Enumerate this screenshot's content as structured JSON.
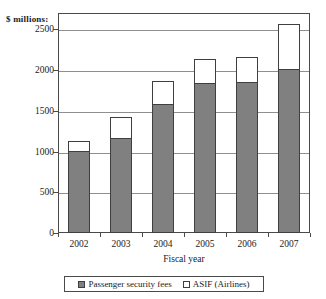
{
  "chart_data": {
    "type": "bar",
    "title": "",
    "subtitle": "",
    "stacked": true,
    "unit_label": "$ millions:",
    "xlabel": "Fiscal year",
    "ylabel": "",
    "ylim": [
      0,
      2700
    ],
    "yticks": [
      0,
      500,
      1000,
      1500,
      2000,
      2500
    ],
    "ytick_labels": [
      "0",
      "500",
      "1000",
      "1500",
      "2000",
      "2500"
    ],
    "grid": true,
    "legend_position": "bottom",
    "categories": [
      "2002",
      "2003",
      "2004",
      "2005",
      "2006",
      "2007"
    ],
    "series": [
      {
        "name": "Passenger security fees",
        "color": "#808080",
        "values": [
          1010,
          1170,
          1580,
          1840,
          1850,
          2010
        ]
      },
      {
        "name": "ASIF (Airlines)",
        "color": "#ffffff",
        "values": [
          120,
          250,
          285,
          300,
          305,
          550
        ]
      }
    ],
    "totals": [
      1130,
      1420,
      1865,
      2140,
      2155,
      2560
    ]
  },
  "legend": {
    "entries": [
      {
        "label": "Passenger security fees",
        "swatch": "filled"
      },
      {
        "label": "ASIF (Airlines)",
        "swatch": "hollow"
      }
    ]
  }
}
